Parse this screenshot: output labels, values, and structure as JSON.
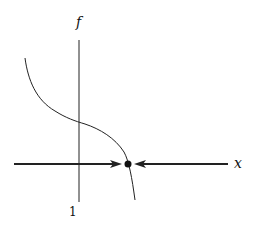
{
  "diagram": {
    "type": "phase-line",
    "axes": {
      "vertical_label": "f",
      "horizontal_label": "x",
      "tick_label": "1"
    },
    "curve": "decreasing function f(x) crossing zero",
    "equilibrium": {
      "type": "stable",
      "marker": "filled-dot"
    },
    "arrows": [
      "right-pointing arrow toward equilibrium from left",
      "left-pointing arrow toward equilibrium from right"
    ],
    "colors": {
      "ink": "#111111",
      "background": "#ffffff"
    }
  }
}
